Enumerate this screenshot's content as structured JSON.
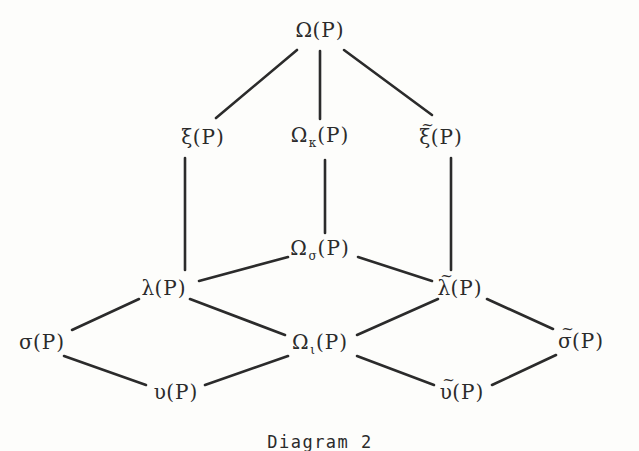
{
  "figure": {
    "caption": "Diagram 2",
    "caption_x": 320,
    "caption_y": 432,
    "ink_color": "#2b2b2b",
    "background_color": "#fdfdfb",
    "width": 639,
    "height": 451
  },
  "nodes": [
    {
      "id": "omega",
      "label": "Ω(P)",
      "base": "Ω",
      "sub": "",
      "tilde": false,
      "x": 320,
      "y": 30
    },
    {
      "id": "xi",
      "label": "ξ(P)",
      "base": "ξ",
      "sub": "",
      "tilde": false,
      "x": 203,
      "y": 137
    },
    {
      "id": "omega-kappa",
      "label": "Ωκ(P)",
      "base": "Ω",
      "sub": "κ",
      "tilde": false,
      "x": 320,
      "y": 137
    },
    {
      "id": "xi-tilde",
      "label": "ξ̃(P)",
      "base": "ξ",
      "sub": "",
      "tilde": true,
      "x": 441,
      "y": 137
    },
    {
      "id": "omega-sigma",
      "label": "Ωσ(P)",
      "base": "Ω",
      "sub": "σ",
      "tilde": false,
      "x": 320,
      "y": 250
    },
    {
      "id": "lambda",
      "label": "λ(P)",
      "base": "λ",
      "sub": "",
      "tilde": false,
      "x": 164,
      "y": 288
    },
    {
      "id": "lambda-tilde",
      "label": "λ̃(P)",
      "base": "λ",
      "sub": "",
      "tilde": true,
      "x": 460,
      "y": 288
    },
    {
      "id": "sigma",
      "label": "σ(P)",
      "base": "σ",
      "sub": "",
      "tilde": false,
      "x": 42,
      "y": 342
    },
    {
      "id": "omega-iota",
      "label": "Ωι(P)",
      "base": "Ω",
      "sub": "ι",
      "tilde": false,
      "x": 320,
      "y": 344
    },
    {
      "id": "sigma-tilde",
      "label": "σ̃(P)",
      "base": "σ",
      "sub": "",
      "tilde": true,
      "x": 581,
      "y": 341
    },
    {
      "id": "upsilon",
      "label": "υ(P)",
      "base": "υ",
      "sub": "",
      "tilde": false,
      "x": 176,
      "y": 392
    },
    {
      "id": "upsilon-tilde",
      "label": "υ̃(P)",
      "base": "υ",
      "sub": "",
      "tilde": true,
      "x": 462,
      "y": 392
    }
  ],
  "edges": [
    {
      "id": "omega-to-xi",
      "from": "omega",
      "to": "xi",
      "x1": 297,
      "y1": 50,
      "x2": 216,
      "y2": 118
    },
    {
      "id": "omega-to-omega-kappa",
      "from": "omega",
      "to": "omega-kappa",
      "x1": 320,
      "y1": 51,
      "x2": 320,
      "y2": 119
    },
    {
      "id": "omega-to-xi-tilde",
      "from": "omega",
      "to": "xi-tilde",
      "x1": 344,
      "y1": 50,
      "x2": 432,
      "y2": 115
    },
    {
      "id": "xi-to-lambda",
      "from": "xi",
      "to": "lambda",
      "x1": 185,
      "y1": 158,
      "x2": 185,
      "y2": 270
    },
    {
      "id": "omega-kappa-to-omega-sigma",
      "from": "omega-kappa",
      "to": "omega-sigma",
      "x1": 325,
      "y1": 160,
      "x2": 325,
      "y2": 233
    },
    {
      "id": "xi-tilde-to-lambda-tilde",
      "from": "xi-tilde",
      "to": "lambda-tilde",
      "x1": 451,
      "y1": 158,
      "x2": 451,
      "y2": 270
    },
    {
      "id": "omega-sigma-to-lambda",
      "from": "omega-sigma",
      "to": "lambda",
      "x1": 288,
      "y1": 257,
      "x2": 199,
      "y2": 281
    },
    {
      "id": "omega-sigma-to-lambda-tilde",
      "from": "omega-sigma",
      "to": "lambda-tilde",
      "x1": 358,
      "y1": 257,
      "x2": 432,
      "y2": 281
    },
    {
      "id": "lambda-to-sigma",
      "from": "lambda",
      "to": "sigma",
      "x1": 139,
      "y1": 299,
      "x2": 72,
      "y2": 330
    },
    {
      "id": "lambda-to-omega-iota",
      "from": "lambda",
      "to": "omega-iota",
      "x1": 190,
      "y1": 299,
      "x2": 285,
      "y2": 335
    },
    {
      "id": "sigma-to-upsilon",
      "from": "sigma",
      "to": "upsilon",
      "x1": 64,
      "y1": 356,
      "x2": 146,
      "y2": 385
    },
    {
      "id": "upsilon-to-omega-iota",
      "from": "upsilon",
      "to": "omega-iota",
      "x1": 205,
      "y1": 385,
      "x2": 288,
      "y2": 356
    },
    {
      "id": "omega-iota-to-upsilon-tilde",
      "from": "omega-iota",
      "to": "upsilon-tilde",
      "x1": 357,
      "y1": 356,
      "x2": 434,
      "y2": 385
    },
    {
      "id": "omega-iota-to-lambda-tilde",
      "from": "omega-iota",
      "to": "lambda-tilde",
      "x1": 357,
      "y1": 335,
      "x2": 438,
      "y2": 299
    },
    {
      "id": "lambda-tilde-to-sigma-tilde",
      "from": "lambda-tilde",
      "to": "sigma-tilde",
      "x1": 487,
      "y1": 299,
      "x2": 553,
      "y2": 329
    },
    {
      "id": "upsilon-tilde-to-sigma-tilde",
      "from": "upsilon-tilde",
      "to": "sigma-tilde",
      "x1": 492,
      "y1": 385,
      "x2": 556,
      "y2": 355
    }
  ]
}
